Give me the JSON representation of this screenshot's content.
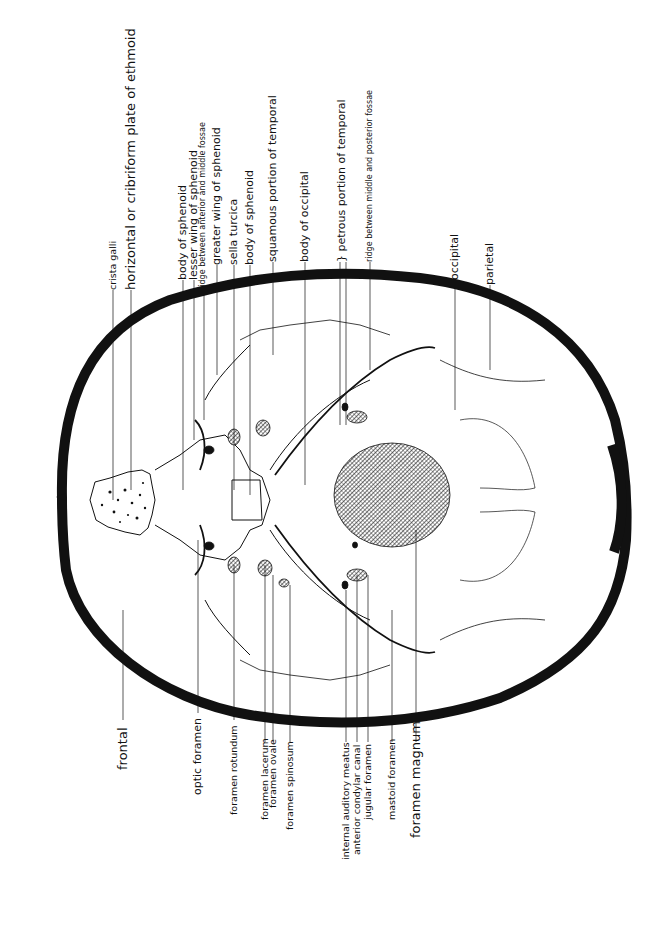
{
  "diagram": {
    "orientation": "rotated 90 degrees, anterior to left",
    "colors": {
      "bone_outline": "#111111",
      "background": "#ffffff",
      "hatch": "#222222"
    },
    "labels_top": [
      {
        "id": "crista-galli",
        "text": "crista galli",
        "x": 113,
        "size": "small"
      },
      {
        "id": "cribriform-plate",
        "text": "horizontal or cribriform plate of ethmoid",
        "x": 131,
        "size": "big"
      },
      {
        "id": "body-of-sphenoid-1",
        "text": "body of sphenoid",
        "x": 183,
        "size": "top"
      },
      {
        "id": "lesser-wing-sphenoid",
        "text": "lesser wing of sphenoid",
        "x": 194,
        "size": "top"
      },
      {
        "id": "ridge-anterior-middle",
        "text": "ridge between anterior and middle fossae",
        "x": 204,
        "size": "tiny"
      },
      {
        "id": "greater-wing-sphenoid",
        "text": "greater wing of sphenoid",
        "x": 217,
        "size": "top"
      },
      {
        "id": "sella-turcica",
        "text": "sella turcica",
        "x": 234,
        "size": "top"
      },
      {
        "id": "body-of-sphenoid-2",
        "text": "body of sphenoid",
        "x": 250,
        "size": "top"
      },
      {
        "id": "squamous-temporal",
        "text": "squamous portion of temporal",
        "x": 273,
        "size": "top"
      },
      {
        "id": "body-of-occipital",
        "text": "body of occipital",
        "x": 305,
        "size": "top"
      },
      {
        "id": "petrous-temporal",
        "text": "} petrous portion of temporal",
        "x": 340,
        "size": "top"
      },
      {
        "id": "ridge-middle-posterior",
        "text": "ridge between middle and posterior fossae",
        "x": 370,
        "size": "tiny"
      },
      {
        "id": "occipital",
        "text": "occipital",
        "x": 455,
        "size": "top"
      },
      {
        "id": "parietal",
        "text": "parietal",
        "x": 490,
        "size": "top"
      }
    ],
    "labels_bottom": [
      {
        "id": "frontal",
        "text": "frontal",
        "x": 123,
        "size": "big"
      },
      {
        "id": "optic-foramen",
        "text": "optic foramen",
        "x": 198,
        "size": "top"
      },
      {
        "id": "foramen-rotundum",
        "text": "foramen rotundum",
        "x": 234,
        "size": "small"
      },
      {
        "id": "foramen-lacerum",
        "text": "foramen lacerum",
        "x": 265,
        "size": "small"
      },
      {
        "id": "foramen-ovale",
        "text": "foramen ovale",
        "x": 273,
        "size": "small"
      },
      {
        "id": "foramen-spinosum",
        "text": "foramen spinosum",
        "x": 290,
        "size": "small"
      },
      {
        "id": "internal-auditory-meatus",
        "text": "internal auditory meatus",
        "x": 346,
        "size": "small"
      },
      {
        "id": "anterior-condylar-canal",
        "text": "anterior condylar canal",
        "x": 357,
        "size": "small"
      },
      {
        "id": "jugular-foramen",
        "text": "jugular foramen",
        "x": 368,
        "size": "small"
      },
      {
        "id": "mastoid-foramen",
        "text": "mastoid foramen",
        "x": 392,
        "size": "small"
      },
      {
        "id": "foramen-magnum",
        "text": "foramen magnum",
        "x": 416,
        "size": "big"
      }
    ]
  }
}
